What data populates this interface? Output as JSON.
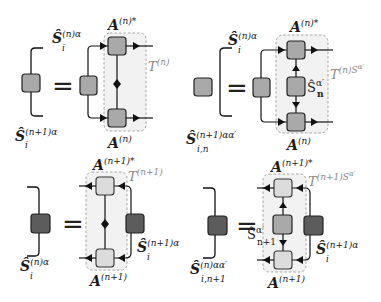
{
  "colors": {
    "box_mid": "#a9a9a9",
    "box_light": "#dcdcdc",
    "box_dark": "#5c5c5c",
    "region_fill": "#f2f2f2",
    "region_border": "#9a9a9a",
    "line": "#111111",
    "t_label": "#8a8a8a"
  },
  "panels": [
    {
      "id": "top-left",
      "lhs_label": {
        "base": "Ŝ",
        "sup": "(n+1)α",
        "sub": "i"
      },
      "rhs_s_label": {
        "base": "Ŝ",
        "sup": "(n)α",
        "sub": "i"
      },
      "top_a_label": {
        "base": "A",
        "sup": "(n)*"
      },
      "bottom_a_label": {
        "base": "A",
        "sup": "(n)"
      },
      "t_label": {
        "base": "T",
        "sup": "(n)"
      }
    },
    {
      "id": "top-right",
      "lhs_label": {
        "base": "Ŝ",
        "sup": "(n+1)αα′",
        "sub": "i,n"
      },
      "rhs_s_label": {
        "base": "Ŝ",
        "sup": "(n)α",
        "sub": "i"
      },
      "top_a_label": {
        "base": "A",
        "sup": "(n)*"
      },
      "bottom_a_label": {
        "base": "A",
        "sup": "(n)"
      },
      "middle_label": {
        "base": "Ŝ",
        "sup": "α′",
        "sub": "n"
      },
      "t_label": {
        "base": "T",
        "sup": "(n)S",
        "supsup": "α′"
      }
    },
    {
      "id": "bottom-left",
      "lhs_label": {
        "base": "Ŝ",
        "sup": "(n)α",
        "sub": "i"
      },
      "rhs_s_label": {
        "base": "Ŝ",
        "sup": "(n+1)α",
        "sub": "i"
      },
      "top_a_label": {
        "base": "A",
        "sup": "(n+1)*"
      },
      "bottom_a_label": {
        "base": "A",
        "sup": "(n+1)"
      },
      "t_label": {
        "base": "T",
        "sup": "(n+1)"
      }
    },
    {
      "id": "bottom-right",
      "lhs_label": {
        "base": "Ŝ",
        "sup": "(n)αα′",
        "sub": "i,n+1"
      },
      "rhs_s_label": {
        "base": "Ŝ",
        "sup": "(n+1)α",
        "sub": "i"
      },
      "top_a_label": {
        "base": "A",
        "sup": "(n+1)*"
      },
      "bottom_a_label": {
        "base": "A",
        "sup": "(n+1)"
      },
      "middle_label": {
        "base": "Ŝ",
        "sup": "α′",
        "sub": "n+1"
      },
      "t_label": {
        "base": "T",
        "sup": "(n+1)S",
        "supsup": "α′"
      }
    }
  ],
  "equals": "="
}
